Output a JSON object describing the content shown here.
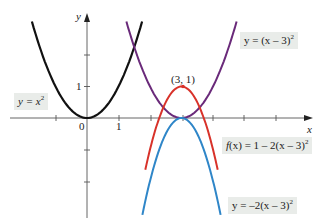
{
  "chart_data": {
    "type": "line",
    "title": "",
    "xlabel": "x",
    "ylabel": "y",
    "xlim": [
      -2.6,
      7.1
    ],
    "ylim": [
      -3.2,
      3.3
    ],
    "grid": false,
    "tick_labels": {
      "x": [
        "0",
        "1"
      ],
      "y": [
        "1"
      ]
    },
    "series": [
      {
        "name": "y = x^2",
        "color": "#111111",
        "expr": "x^2",
        "x_range": [
          -1.75,
          1.75
        ]
      },
      {
        "name": "y = (x - 3)^2",
        "color": "#6a2a7a",
        "expr": "(x-3)^2",
        "x_range": [
          1.25,
          4.75
        ]
      },
      {
        "name": "f(x) = 1 - 2(x - 3)^2",
        "color": "#d8322a",
        "expr": "1-2*(x-3)^2",
        "x_range": [
          1.85,
          4.15
        ]
      },
      {
        "name": "y = -2(x - 3)^2",
        "color": "#2f86c8",
        "expr": "-2*(x-3)^2",
        "x_range": [
          1.76,
          4.24
        ]
      }
    ],
    "annotations": [
      {
        "text": "(3, 1)",
        "x": 3,
        "y": 1,
        "type": "point"
      }
    ]
  },
  "labels": {
    "y_axis": "y",
    "x_axis": "x",
    "origin": "0",
    "x_tick_1": "1",
    "y_tick_1": "1",
    "vertex": "(3, 1)",
    "l_x2_pre": "y = x",
    "l_x2_sup": "2",
    "l_shift_pre": "y = (x – 3)",
    "l_shift_sup": "2",
    "l_f_pre_it": "f",
    "l_f_mid": "(x) = 1 – 2(x – 3)",
    "l_f_sup": "2",
    "l_neg_pre": "y = –2(x – 3)",
    "l_neg_sup": "2"
  }
}
